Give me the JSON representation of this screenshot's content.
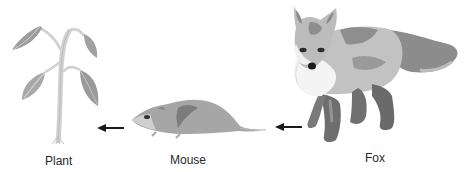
{
  "diagram": {
    "type": "food-chain",
    "organisms": [
      {
        "name": "Plant",
        "icon": "plant-icon"
      },
      {
        "name": "Mouse",
        "icon": "mouse-icon"
      },
      {
        "name": "Fox",
        "icon": "fox-icon"
      }
    ],
    "arrows": [
      {
        "from": "Mouse",
        "to": "Plant",
        "icon": "arrow-left-icon"
      },
      {
        "from": "Fox",
        "to": "Mouse",
        "icon": "arrow-left-icon"
      }
    ]
  },
  "colors": {
    "light_gray": "#c8c8c8",
    "mid_gray": "#a4a4a4",
    "dark_gray": "#7a7a7a",
    "darker_gray": "#5e5e5e",
    "arrow": "#1a1a1a",
    "text": "#2a2a2a"
  }
}
